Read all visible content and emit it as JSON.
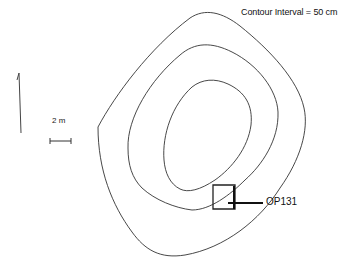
{
  "legend": {
    "contour_interval_label": "Contour Interval = 50 cm"
  },
  "scale_bar": {
    "label": "2 m"
  },
  "north_arrow": {
    "icon": "north-arrow-icon"
  },
  "contours": [
    {
      "name": "outer",
      "level": 1
    },
    {
      "name": "middle",
      "level": 2
    },
    {
      "name": "inner",
      "level": 3
    }
  ],
  "excavation_unit": {
    "label": "OP131"
  },
  "colors": {
    "line": "#333333",
    "background": "#ffffff"
  }
}
